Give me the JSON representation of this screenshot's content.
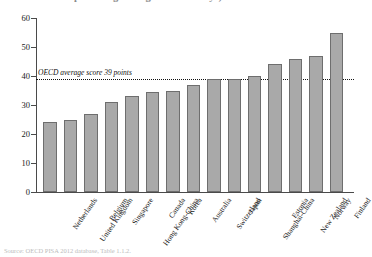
{
  "figure": {
    "title_clipped": "percentage of digital native boys)",
    "source_clipped": "Source: OECD PISA 2012 database, Table 1.1.2."
  },
  "annotation": {
    "ref_label": "OECD average score 39 points",
    "ref_value": 39
  },
  "axis": {
    "y_ticks": [
      "60",
      "50",
      "40",
      "30",
      "20",
      "10",
      "0"
    ]
  },
  "colors": {
    "bar_fill": "#a9a9a9",
    "bar_stroke": "#6e6e6e",
    "axis": "#4a4a4a",
    "ref_line": "#111111"
  },
  "chart_data": {
    "type": "bar",
    "title": "percentage of digital native boys)",
    "xlabel": "",
    "ylabel": "",
    "ylim": [
      0,
      60
    ],
    "ytick_step": 10,
    "grid": false,
    "legend": "none",
    "categories": [
      "Netherlands",
      "United Kingdom",
      "Belgium",
      "Singapore",
      "Hong Kong-China",
      "Canada",
      "Korea",
      "Australia",
      "Switzerland",
      "Japan",
      "Shanghai-China",
      "Estonia",
      "New Zealand",
      "Norway",
      "Finland"
    ],
    "values": [
      24,
      25,
      27,
      31,
      33,
      34.5,
      35,
      37,
      39,
      39,
      40,
      44,
      46,
      47,
      55
    ],
    "annotations": [
      {
        "type": "hline",
        "value": 39,
        "label": "OECD average score 39 points",
        "style": "dotted"
      }
    ]
  }
}
